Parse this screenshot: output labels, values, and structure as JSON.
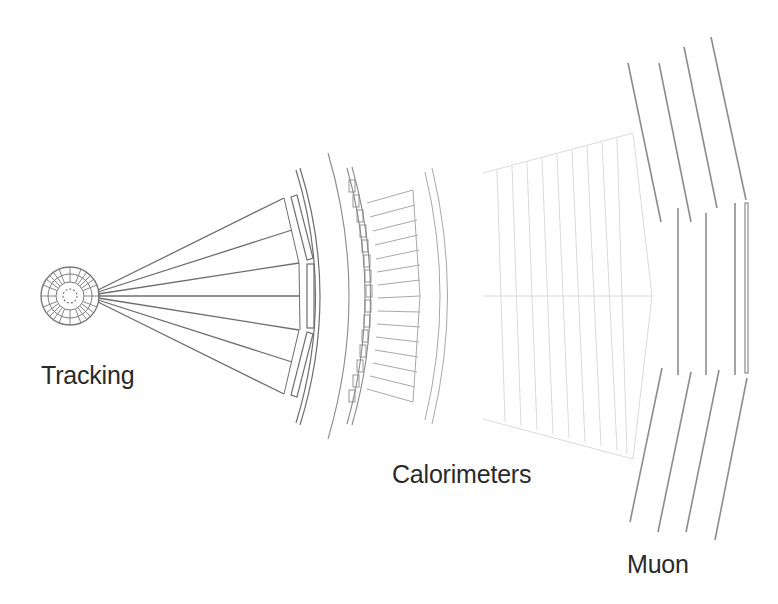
{
  "diagram": {
    "type": "detector-cross-section",
    "labels": {
      "tracking": "Tracking",
      "calorimeters": "Calorimeters",
      "muon": "Muon"
    },
    "colors": {
      "background": "#ffffff",
      "tracking_lines": "#6e6e6e",
      "calorimeter_lines": "#9a9a9a",
      "calorimeter_outer_lines": "#d8d8d8",
      "muon_lines": "#8c8c8c",
      "label_text": "#2a2a2a"
    }
  }
}
